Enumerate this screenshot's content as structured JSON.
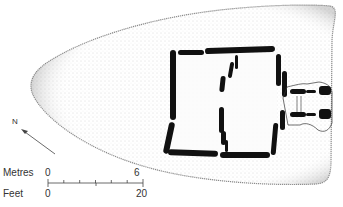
{
  "figure": {
    "type": "archaeological-site-plan",
    "colors": {
      "stones": "#111111",
      "mound_stipple": "#9a9a9a",
      "background": "#ffffff",
      "text": "#333333"
    }
  },
  "north_arrow": {
    "label": "N"
  },
  "scale_bar": {
    "metres_label": "Metres",
    "metres_start": "0",
    "metres_end": "6",
    "feet_label": "Feet",
    "feet_start": "0",
    "feet_end": "20"
  }
}
